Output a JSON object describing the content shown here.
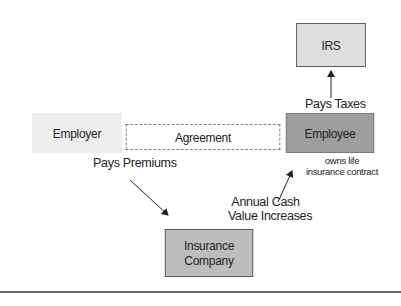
{
  "diagram": {
    "nodes": {
      "irs": "IRS",
      "employer": "Employer",
      "agreement": "Agreement",
      "employee": "Employee",
      "insurance_line1": "Insurance",
      "insurance_line2": "Company"
    },
    "labels": {
      "pays_taxes": "Pays Taxes",
      "pays_premiums": "Pays Premiums",
      "cash_value_line1": "Annual Cash",
      "cash_value_line2": "Value Increases",
      "owns_line1": "owns life",
      "owns_line2": "insurance contract"
    },
    "edges": [
      {
        "from": "employee",
        "to": "irs",
        "label": "Pays Taxes"
      },
      {
        "from": "employer",
        "to": "insurance",
        "label": "Pays Premiums"
      },
      {
        "from": "insurance",
        "to": "employee",
        "label": "Annual Cash Value Increases"
      },
      {
        "from": "employer",
        "to": "employee",
        "label": "Agreement"
      }
    ],
    "colors": {
      "irs_fill": "#dedede",
      "employer_fill": "#efefef",
      "employee_fill": "#9e9e9e",
      "insurance_fill": "#bdbdbd"
    }
  }
}
